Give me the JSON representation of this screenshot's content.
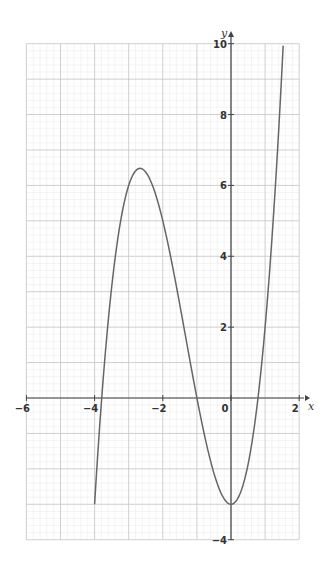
{
  "chart_data": {
    "type": "line",
    "title": "",
    "xlabel": "x",
    "ylabel": "y",
    "xlim": [
      -6,
      2
    ],
    "ylim": [
      -4,
      10
    ],
    "grid": true,
    "grid_minor_step": 0.2,
    "x_ticks": [
      -6,
      -4,
      -2,
      0,
      2
    ],
    "x_tick_labels": [
      "−6",
      "−4",
      "−2",
      "0",
      "2"
    ],
    "y_ticks": [
      -4,
      2,
      4,
      6,
      8,
      10
    ],
    "y_tick_labels": [
      "−4",
      "2",
      "4",
      "6",
      "8",
      "10"
    ],
    "series": [
      {
        "name": "y = x^3 + 4x^2 - 3",
        "color": "#666666",
        "x_range": [
          -4,
          1.53
        ],
        "points": [
          [
            -4,
            -3
          ],
          [
            -3.79,
            0
          ],
          [
            -3.5,
            3.13
          ],
          [
            -3,
            6
          ],
          [
            -2.67,
            6.48
          ],
          [
            -2,
            5
          ],
          [
            -1.5,
            2.63
          ],
          [
            -1,
            0
          ],
          [
            -0.5,
            -2.13
          ],
          [
            0,
            -3
          ],
          [
            0.5,
            -1.88
          ],
          [
            0.79,
            0
          ],
          [
            1,
            2
          ],
          [
            1.25,
            5.2
          ],
          [
            1.53,
            10
          ]
        ]
      }
    ],
    "annotations": {
      "local_max": [
        -2.67,
        6.48
      ],
      "local_min": [
        0,
        -3
      ],
      "roots": [
        -3.79,
        -1,
        0.79
      ]
    }
  },
  "axes": {
    "x_label": "x",
    "y_label": "y"
  }
}
